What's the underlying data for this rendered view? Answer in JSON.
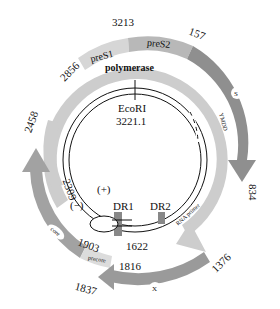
{
  "colors": {
    "light": "#cfcfcf",
    "mid": "#b4b4b4",
    "dark": "#8c8c8c",
    "line": "#111111"
  },
  "genes": {
    "preS1": "preS1",
    "preS2": "preS2",
    "S": "S",
    "polymerase": "polymerase",
    "core": "core",
    "precore": "precore",
    "X": "X"
  },
  "positions": {
    "p2856": "2856",
    "p3213": "3213",
    "p157": "157",
    "p834": "834",
    "p2458": "2458",
    "p2309": "2309",
    "p1903": "1903",
    "p1816": "1816",
    "p1837": "1837",
    "p1376": "1376",
    "p1622": "1622"
  },
  "features": {
    "ecori": "EcoRI",
    "ecori_pos": "3221.1",
    "ymdd": "YMDD",
    "rna_primer": "RNA primer",
    "dr1": "DR1",
    "dr2": "DR2",
    "plus": "(+)",
    "minus": "(−)"
  }
}
